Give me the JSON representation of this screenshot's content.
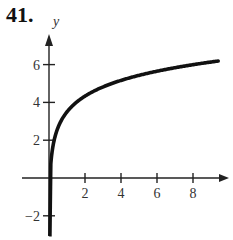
{
  "problem_number": "41.",
  "chart_data": {
    "type": "line",
    "title": "",
    "xlabel": "",
    "ylabel": "y",
    "x_ticks": [
      2,
      4,
      6,
      8
    ],
    "y_ticks": [
      -2,
      2,
      4,
      6
    ],
    "xlim": [
      0,
      9.4
    ],
    "ylim": [
      -2.5,
      7.5
    ],
    "grid": false,
    "series": [
      {
        "name": "f(x)",
        "x": [
          0.05,
          0.1,
          0.25,
          0.5,
          1,
          2,
          4,
          6,
          8,
          9.4
        ],
        "y": [
          -2.4,
          0.74,
          1.84,
          2.67,
          3.5,
          4.33,
          5.16,
          5.65,
          6.0,
          6.19
        ]
      }
    ]
  }
}
